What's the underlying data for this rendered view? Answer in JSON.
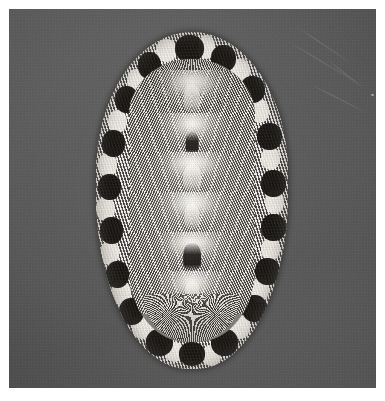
{
  "plate": {
    "medium": "black-and-white photographic print",
    "background_color": "#5b5b5b",
    "margin_color": "#ffffff",
    "photo_region": {
      "x": 9,
      "y": 9,
      "width": 367,
      "height": 379
    },
    "caption": "",
    "label": "",
    "visible_text": []
  },
  "subject": {
    "name": "chiton",
    "common_name": "chiton (polyplacophoran mollusk)",
    "view": "dorsal view",
    "orientation": "anterior (head) at top, posterior (tail) at bottom",
    "outline": "elongate oval",
    "bounds": {
      "x": 87,
      "y": 23,
      "width": 192,
      "height": 337
    },
    "colors": {
      "girdle_light": "#f2efe8",
      "girdle_dark": "#14120f",
      "valve_mid": "#8d8880",
      "jugum_dark": "#14120f",
      "highlight": "#fbf9f4"
    }
  },
  "anatomy": {
    "girdle": {
      "label": "girdle (perinotum)",
      "texture": "dense granular scales",
      "pattern": "alternating dark and white blotches around the margin",
      "dark_blotch_count": 18
    },
    "valves": {
      "label": "shell valves",
      "count": 8,
      "head_valve": "semicircular anterior valve with radiating fan of striae",
      "intermediate_valves": 6,
      "tail_valve": "posterior valve with concentric-radiate fan",
      "sculpture": "fine radiating riblets forming chevrons either side of the midline",
      "jugum": "pale to dark midline ridge running the length of the animal"
    }
  },
  "artifacts": {
    "scratches": [
      {
        "id": "scr1",
        "note": "faint diagonal emulsion scratch, upper right"
      },
      {
        "id": "scr2",
        "note": "faint diagonal emulsion scratch, upper right"
      },
      {
        "id": "scr3",
        "note": "faint diagonal emulsion scratch, right"
      },
      {
        "id": "scr4",
        "note": "faint diagonal emulsion scratch, upper right"
      }
    ],
    "specks": [
      {
        "x": 371,
        "y": 94,
        "note": "small light speck in right margin"
      }
    ]
  },
  "structure": {
    "valve_rows": [
      {
        "id": "v1",
        "top": 4,
        "height": 16,
        "jugum": "pale",
        "jugum_top": 30,
        "jugum_height": 62,
        "jugum_width": 13
      },
      {
        "id": "v2",
        "top": 19,
        "height": 15,
        "jugum": "dark",
        "jugum_top": 46,
        "jugum_height": 52,
        "jugum_width": 10
      },
      {
        "id": "v3",
        "top": 33,
        "height": 15,
        "jugum": "pale",
        "jugum_top": 30,
        "jugum_height": 60,
        "jugum_width": 14
      },
      {
        "id": "v4",
        "top": 47,
        "height": 15,
        "jugum": "pale",
        "jugum_top": 28,
        "jugum_height": 60,
        "jugum_width": 12
      },
      {
        "id": "v5",
        "top": 61,
        "height": 15,
        "jugum": "dark",
        "jugum_top": 26,
        "jugum_height": 64,
        "jugum_width": 14
      },
      {
        "id": "v6",
        "top": 75,
        "height": 15,
        "jugum": "pale",
        "jugum_top": 24,
        "jugum_height": 58,
        "jugum_width": 11
      }
    ],
    "girdle_blotches_dark": [
      {
        "l": 41,
        "t": 1,
        "w": 15,
        "h": 8
      },
      {
        "l": 22,
        "t": 6,
        "w": 12,
        "h": 8
      },
      {
        "l": 60,
        "t": 4,
        "w": 13,
        "h": 8
      },
      {
        "l": 10,
        "t": 16,
        "w": 12,
        "h": 8
      },
      {
        "l": 75,
        "t": 13,
        "w": 13,
        "h": 8
      },
      {
        "l": 3,
        "t": 29,
        "w": 12,
        "h": 8
      },
      {
        "l": 84,
        "t": 27,
        "w": 13,
        "h": 8
      },
      {
        "l": 1,
        "t": 42,
        "w": 12,
        "h": 8
      },
      {
        "l": 86,
        "t": 41,
        "w": 13,
        "h": 8
      },
      {
        "l": 2,
        "t": 55,
        "w": 12,
        "h": 8
      },
      {
        "l": 86,
        "t": 54,
        "w": 13,
        "h": 8
      },
      {
        "l": 5,
        "t": 68,
        "w": 12,
        "h": 8
      },
      {
        "l": 83,
        "t": 67,
        "w": 13,
        "h": 8
      },
      {
        "l": 12,
        "t": 79,
        "w": 13,
        "h": 8
      },
      {
        "l": 76,
        "t": 78,
        "w": 13,
        "h": 8
      },
      {
        "l": 26,
        "t": 88,
        "w": 14,
        "h": 8
      },
      {
        "l": 60,
        "t": 88,
        "w": 14,
        "h": 8
      },
      {
        "l": 43,
        "t": 92,
        "w": 14,
        "h": 7
      }
    ],
    "girdle_blotches_light": [
      {
        "l": 31,
        "t": 2,
        "w": 11,
        "h": 7
      },
      {
        "l": 53,
        "t": 1,
        "w": 9,
        "h": 7
      },
      {
        "l": 16,
        "t": 11,
        "w": 10,
        "h": 7
      },
      {
        "l": 70,
        "t": 8,
        "w": 10,
        "h": 7
      },
      {
        "l": 6,
        "t": 23,
        "w": 10,
        "h": 7
      },
      {
        "l": 80,
        "t": 20,
        "w": 10,
        "h": 7
      },
      {
        "l": 1,
        "t": 36,
        "w": 10,
        "h": 7
      },
      {
        "l": 86,
        "t": 34,
        "w": 10,
        "h": 7
      },
      {
        "l": 0,
        "t": 49,
        "w": 10,
        "h": 7
      },
      {
        "l": 88,
        "t": 47,
        "w": 10,
        "h": 7
      },
      {
        "l": 2,
        "t": 62,
        "w": 10,
        "h": 7
      },
      {
        "l": 86,
        "t": 61,
        "w": 10,
        "h": 7
      },
      {
        "l": 8,
        "t": 74,
        "w": 10,
        "h": 7
      },
      {
        "l": 80,
        "t": 73,
        "w": 10,
        "h": 7
      },
      {
        "l": 19,
        "t": 84,
        "w": 11,
        "h": 7
      },
      {
        "l": 69,
        "t": 84,
        "w": 11,
        "h": 7
      },
      {
        "l": 36,
        "t": 92,
        "w": 10,
        "h": 6
      },
      {
        "l": 55,
        "t": 93,
        "w": 10,
        "h": 6
      }
    ]
  }
}
